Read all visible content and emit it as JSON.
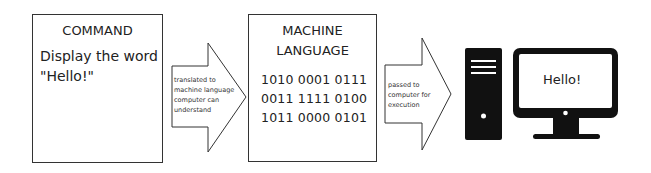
{
  "command_box": {
    "title": "COMMAND",
    "lines": [
      "Display the word",
      "\"Hello!\""
    ]
  },
  "arrow1": {
    "label_lines": [
      "translated to",
      "machine language",
      "computer can",
      "understand"
    ]
  },
  "machine_box": {
    "title_lines": [
      "MACHINE",
      "LANGUAGE"
    ],
    "code_lines": [
      "1010 0001 0111",
      "0011 1111 0100",
      "1011 0000 0101"
    ]
  },
  "arrow2": {
    "label_lines": [
      "passed to",
      "computer for",
      "execution"
    ]
  },
  "computer": {
    "tower_icon": "computer-tower-icon",
    "monitor_icon": "monitor-icon",
    "screen_text": "Hello!"
  },
  "colors": {
    "stroke": "#333333",
    "device_fill": "#111111",
    "background": "#ffffff"
  }
}
